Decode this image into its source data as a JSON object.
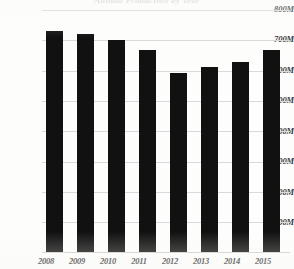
{
  "chart_data": {
    "type": "bar",
    "title": "Annual Production by Year",
    "title_visibility": "clipped-faint",
    "xlabel": "",
    "ylabel": "",
    "categories": [
      "2008",
      "2009",
      "2010",
      "2011",
      "2012",
      "2013",
      "2014",
      "2015"
    ],
    "values": [
      730,
      722,
      700,
      667,
      591,
      611,
      627,
      667
    ],
    "value_unit": "M",
    "ylim": [
      0,
      800
    ],
    "yticks": [
      100,
      200,
      300,
      400,
      500,
      600,
      700,
      800
    ],
    "ytick_labels": [
      "100M",
      "200M",
      "300M",
      "400M",
      "500M",
      "600M",
      "700M",
      "800M"
    ],
    "grid": true,
    "grid_axis": "y",
    "legend": null,
    "legend_position": "none",
    "series": [
      {
        "name": "Value",
        "values": [
          730,
          722,
          700,
          667,
          591,
          611,
          627,
          667
        ]
      }
    ],
    "bar_color": "#111111",
    "grid_color": "#d9d9d9",
    "background_color": "#fdfdfb",
    "axis_text_color": "#2c2c2c"
  }
}
